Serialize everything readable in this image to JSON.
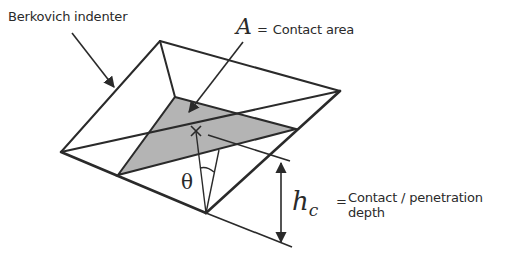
{
  "diagram": {
    "type": "Berkovich indentation schematic",
    "labels": {
      "indenter": "Berkovich indenter",
      "area_symbol": "A",
      "area_eq": "=",
      "area_text": "Contact area",
      "angle_symbol": "θ",
      "depth_symbol": "h",
      "depth_subscript": "c",
      "depth_eq": "=",
      "depth_text_line1": "Contact / penetration",
      "depth_text_line2": "depth"
    },
    "colors": {
      "stroke": "#2a2a2a",
      "contact_fill": "#b4b4b4",
      "background": "#ffffff"
    },
    "geometry": {
      "outer": {
        "left": [
          61,
          152
        ],
        "top": [
          160,
          41
        ],
        "right": [
          340,
          91
        ],
        "bottom": [
          206,
          213
        ]
      },
      "contact_triangle": [
        [
          175,
          97
        ],
        [
          296,
          129
        ],
        [
          118,
          175
        ]
      ],
      "apex_marker": [
        196,
        131
      ]
    }
  }
}
